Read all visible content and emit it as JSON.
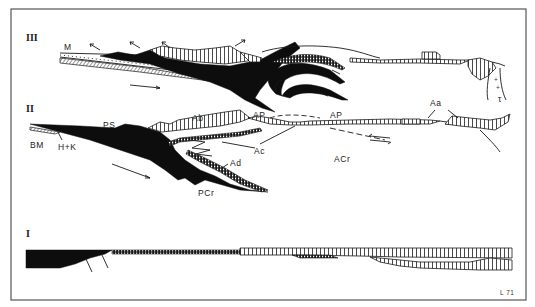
{
  "figure": {
    "code": "L 71",
    "frame": {
      "left": 11,
      "top": 9,
      "right": 526,
      "bottom": 300
    }
  },
  "sections": [
    {
      "id": "III",
      "label": "III",
      "labels": [
        {
          "text": "M"
        }
      ],
      "symbols": [
        {
          "text": "τ"
        }
      ]
    },
    {
      "id": "II",
      "label": "II",
      "labels": [
        {
          "text": "BM"
        },
        {
          "text": "H+K"
        },
        {
          "text": "PS"
        },
        {
          "text": "Ab"
        },
        {
          "text": "AP"
        },
        {
          "text": "AP"
        },
        {
          "text": "Ac"
        },
        {
          "text": "Ad"
        },
        {
          "text": "PCr"
        },
        {
          "text": "ACr"
        },
        {
          "text": "Aa"
        }
      ]
    },
    {
      "id": "I",
      "label": "I",
      "labels": []
    }
  ],
  "colors": {
    "ink": "#0d0d0d",
    "paper": "#ffffff",
    "frame": "#555555"
  }
}
